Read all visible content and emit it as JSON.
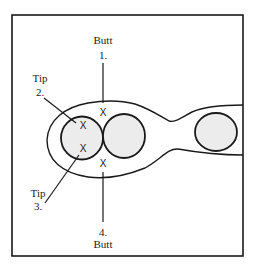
{
  "diagram": {
    "colors": {
      "stroke": "#1a1a1a",
      "ball_fill": "#ececec",
      "background": "#ffffff"
    },
    "labels": {
      "butt_1": {
        "word": "Butt",
        "number": "1."
      },
      "tip_2": {
        "word": "Tip",
        "number": "2."
      },
      "tip_3": {
        "word": "Tip",
        "number": "3."
      },
      "butt_4": {
        "number": "4.",
        "word": "Butt"
      }
    },
    "marks": {
      "x1": "X",
      "x2": "X",
      "x3": "X",
      "x4": "X"
    },
    "objects": {
      "balls": [
        "left-ball",
        "middle-ball",
        "far-right-ball"
      ],
      "outline": "rail-outline"
    }
  }
}
